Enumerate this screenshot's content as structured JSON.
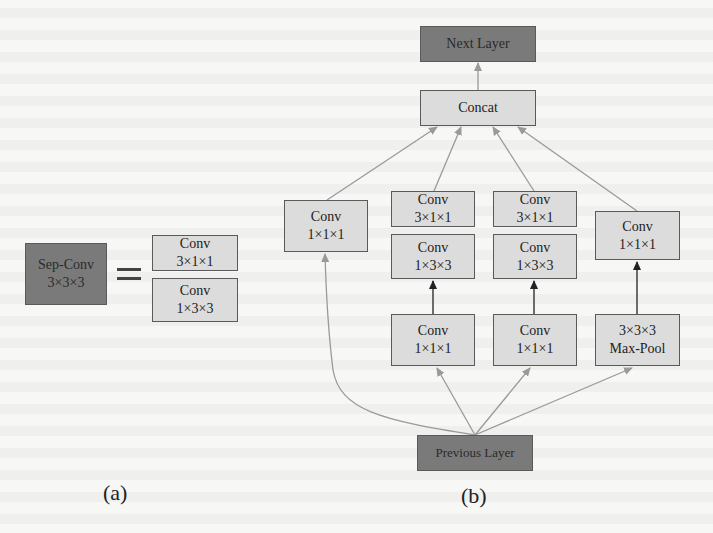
{
  "colors": {
    "background": "#f7f7f6",
    "light_box": "#dcdcdc",
    "dark_box": "#7a7a7a",
    "border": "#5a5a5a",
    "edge_gray": "#9a9a9a",
    "edge_black": "#222222"
  },
  "panel_a": {
    "label": "(a)",
    "sep_conv": {
      "title": "Sep-Conv",
      "kernel": "3×3×3"
    },
    "equals": "=",
    "decomposition": [
      {
        "title": "Conv",
        "kernel": "3×1×1"
      },
      {
        "title": "Conv",
        "kernel": "1×3×3"
      }
    ]
  },
  "panel_b": {
    "label": "(b)",
    "next_layer": "Next Layer",
    "concat": "Concat",
    "previous_layer": "Previous Layer",
    "branches": [
      {
        "name": "branch-1",
        "nodes": [
          {
            "title": "Conv",
            "kernel": "1×1×1"
          }
        ]
      },
      {
        "name": "branch-2",
        "nodes": [
          {
            "title": "Conv",
            "kernel": "1×1×1"
          },
          {
            "title": "Conv",
            "kernel": "1×3×3"
          },
          {
            "title": "Conv",
            "kernel": "3×1×1"
          }
        ]
      },
      {
        "name": "branch-3",
        "nodes": [
          {
            "title": "Conv",
            "kernel": "1×1×1"
          },
          {
            "title": "Conv",
            "kernel": "1×3×3"
          },
          {
            "title": "Conv",
            "kernel": "3×1×1"
          }
        ]
      },
      {
        "name": "branch-4",
        "nodes": [
          {
            "title": "3×3×3",
            "kernel": "Max-Pool"
          },
          {
            "title": "Conv",
            "kernel": "1×1×1"
          }
        ]
      }
    ]
  }
}
